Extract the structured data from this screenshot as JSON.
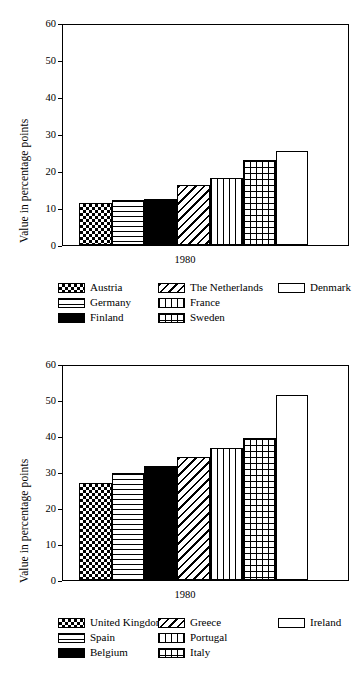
{
  "page": {
    "background": "#ffffff",
    "foreground": "#000000",
    "width": 363,
    "height": 682
  },
  "charts": [
    {
      "id": "chart-top",
      "chart_data": {
        "type": "bar",
        "title": "",
        "xlabel": "",
        "ylabel": "Value in percentage points",
        "categories": [
          "1980"
        ],
        "xticklabels": [
          "1980"
        ],
        "ylim": [
          0,
          60
        ],
        "yticks": [
          0,
          10,
          20,
          30,
          40,
          50,
          60
        ],
        "yticklabels": [
          "0",
          "10",
          "20",
          "30",
          "40",
          "50",
          "60"
        ],
        "grid": false,
        "legend_position": "below",
        "series": [
          {
            "name": "Austria",
            "values": [
              11.3
            ],
            "pattern": "checker"
          },
          {
            "name": "Germany",
            "values": [
              12.3
            ],
            "pattern": "hlines"
          },
          {
            "name": "Finland",
            "values": [
              12.5
            ],
            "pattern": "solid"
          },
          {
            "name": "The Netherlands",
            "values": [
              16.2
            ],
            "pattern": "diag"
          },
          {
            "name": "France",
            "values": [
              18.2
            ],
            "pattern": "vlines"
          },
          {
            "name": "Sweden",
            "values": [
              23.0
            ],
            "pattern": "grid"
          },
          {
            "name": "Denmark",
            "values": [
              25.5
            ],
            "pattern": "blank"
          }
        ]
      },
      "legend": {
        "columns": [
          [
            {
              "label": "Austria",
              "pattern": "checker"
            },
            {
              "label": "Germany",
              "pattern": "hlines"
            },
            {
              "label": "Finland",
              "pattern": "solid"
            }
          ],
          [
            {
              "label": "The Netherlands",
              "pattern": "diag"
            },
            {
              "label": "France",
              "pattern": "vlines"
            },
            {
              "label": "Sweden",
              "pattern": "grid"
            }
          ],
          [
            {
              "label": "Denmark",
              "pattern": "blank"
            }
          ]
        ]
      }
    },
    {
      "id": "chart-bottom",
      "chart_data": {
        "type": "bar",
        "title": "",
        "xlabel": "",
        "ylabel": "Value in percentage points",
        "categories": [
          "1980"
        ],
        "xticklabels": [
          "1980"
        ],
        "ylim": [
          0,
          60
        ],
        "yticks": [
          0,
          10,
          20,
          30,
          40,
          50,
          60
        ],
        "yticklabels": [
          "0",
          "10",
          "20",
          "30",
          "40",
          "50",
          "60"
        ],
        "grid": false,
        "legend_position": "below",
        "series": [
          {
            "name": "United Kingdom",
            "values": [
              27.0
            ],
            "pattern": "checker"
          },
          {
            "name": "Spain",
            "values": [
              29.7
            ],
            "pattern": "hlines"
          },
          {
            "name": "Belgium",
            "values": [
              31.8
            ],
            "pattern": "solid"
          },
          {
            "name": "Greece",
            "values": [
              34.2
            ],
            "pattern": "diag"
          },
          {
            "name": "Portugal",
            "values": [
              36.8
            ],
            "pattern": "vlines"
          },
          {
            "name": "Italy",
            "values": [
              39.5
            ],
            "pattern": "grid"
          },
          {
            "name": "Ireland",
            "values": [
              51.5
            ],
            "pattern": "blank"
          }
        ]
      },
      "legend": {
        "columns": [
          [
            {
              "label": "United Kingdom",
              "pattern": "checker"
            },
            {
              "label": "Spain",
              "pattern": "hlines"
            },
            {
              "label": "Belgium",
              "pattern": "solid"
            }
          ],
          [
            {
              "label": "Greece",
              "pattern": "diag"
            },
            {
              "label": "Portugal",
              "pattern": "vlines"
            },
            {
              "label": "Italy",
              "pattern": "grid"
            }
          ],
          [
            {
              "label": "Ireland",
              "pattern": "blank"
            }
          ]
        ]
      }
    }
  ]
}
